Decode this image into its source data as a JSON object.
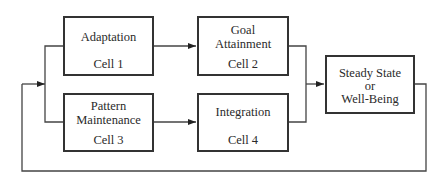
{
  "diagram": {
    "type": "flow-diagram",
    "nodes": [
      {
        "id": "cell1",
        "title": "Adaptation",
        "cell": "Cell 1"
      },
      {
        "id": "cell2",
        "title_line1": "Goal",
        "title_line2": "Attainment",
        "cell": "Cell 2"
      },
      {
        "id": "cell3",
        "title_line1": "Pattern",
        "title_line2": "Maintenance",
        "cell": "Cell 3"
      },
      {
        "id": "cell4",
        "title": "Integration",
        "cell": "Cell 4"
      },
      {
        "id": "outcome",
        "line1": "Steady State",
        "line2": "or",
        "line3": "Well-Being"
      }
    ],
    "edges": [
      {
        "from": "cell1",
        "to": "cell2"
      },
      {
        "from": "cell3",
        "to": "cell4"
      },
      {
        "from": "cell2",
        "to": "outcome"
      },
      {
        "from": "cell4",
        "to": "outcome"
      },
      {
        "from": "outcome",
        "to": "cell1",
        "type": "feedback"
      },
      {
        "from": "outcome",
        "to": "cell3",
        "type": "feedback"
      }
    ],
    "colors": {
      "line": "#333333",
      "background": "#ffffff"
    }
  }
}
